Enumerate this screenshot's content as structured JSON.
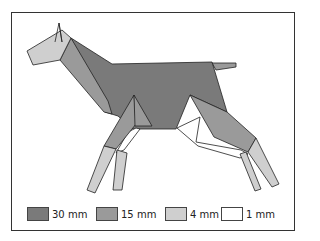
{
  "figure": {
    "colors": {
      "thick_30mm": "#7a7a7a",
      "thick_15mm": "#9a9a9a",
      "thick_4mm": "#cfcfcf",
      "thick_1mm": "#ffffff",
      "outline": "#222222"
    }
  },
  "legend": {
    "items": [
      {
        "label": "30 mm",
        "color": "#7a7a7a"
      },
      {
        "label": "15 mm",
        "color": "#9a9a9a"
      },
      {
        "label": "4 mm",
        "color": "#cfcfcf"
      },
      {
        "label": "1 mm",
        "color": "#ffffff"
      }
    ]
  }
}
